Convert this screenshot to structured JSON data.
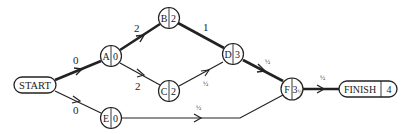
{
  "diagram": {
    "type": "activity-network",
    "nodes": {
      "start": {
        "label": "START"
      },
      "a": {
        "label": "A",
        "value": "0"
      },
      "b": {
        "label": "B",
        "value": "2"
      },
      "c": {
        "label": "C",
        "value": "2"
      },
      "d": {
        "label": "D",
        "value": "3"
      },
      "e": {
        "label": "E",
        "value": "0"
      },
      "f": {
        "label": "F",
        "value": "3",
        "value_frac": "½"
      },
      "finish": {
        "label": "FINISH",
        "value": "4"
      }
    },
    "edges": [
      {
        "from": "START",
        "to": "A",
        "weight": "0",
        "critical": true
      },
      {
        "from": "START",
        "to": "E",
        "weight": "0",
        "critical": false
      },
      {
        "from": "A",
        "to": "B",
        "weight": "2",
        "critical": true
      },
      {
        "from": "A",
        "to": "C",
        "weight": "2",
        "critical": false
      },
      {
        "from": "B",
        "to": "D",
        "weight": "1",
        "critical": true
      },
      {
        "from": "C",
        "to": "D",
        "weight": "½",
        "critical": false
      },
      {
        "from": "D",
        "to": "F",
        "weight": "½",
        "critical": true
      },
      {
        "from": "E",
        "to": "F",
        "weight": "½",
        "critical": false
      },
      {
        "from": "F",
        "to": "FINISH",
        "weight": "½",
        "critical": true
      }
    ],
    "edge_labels": {
      "start_a": "0",
      "start_e": "0",
      "a_b": "2",
      "a_c": "2",
      "b_d": "1",
      "c_d": "½",
      "d_f": "½",
      "e_f": "½",
      "f_finish": "½"
    }
  }
}
